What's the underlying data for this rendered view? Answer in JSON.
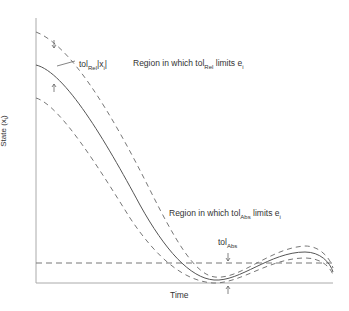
{
  "axes": {
    "x_label": "Time",
    "y_label": "State (x",
    "y_label_sub": "i",
    "y_label_close": ")"
  },
  "annotations": {
    "tol_rel_label": "tol",
    "tol_rel_sub": "Rel",
    "tol_rel_suffix": "|x",
    "tol_rel_suffix_sub": "i",
    "tol_rel_suffix_close": "|",
    "region_rel_prefix": "Region in which tol",
    "region_rel_sub": "Rel",
    "region_rel_suffix": " limits e",
    "region_rel_suffix_sub": "i",
    "region_abs_prefix": "Region in which tol",
    "region_abs_sub": "Abs",
    "region_abs_suffix": " limits e",
    "region_abs_suffix_sub": "i",
    "tol_abs_label": "tol",
    "tol_abs_sub": "Abs"
  },
  "colors": {
    "curve": "#555555",
    "dashed": "#777777",
    "axis": "#999999"
  }
}
